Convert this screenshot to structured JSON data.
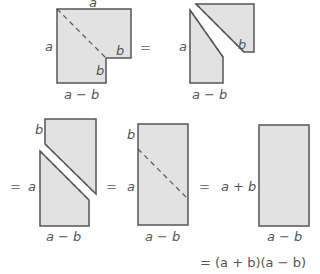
{
  "figure": {
    "type": "difference-of-squares proof",
    "colors": {
      "fill": "#e2e2e2",
      "stroke": "#555555",
      "text": "#555555"
    },
    "step1": {
      "top": "a",
      "left": "a",
      "inner_right": "b",
      "inner_bottom": "b",
      "bottom": "a − b"
    },
    "step2": {
      "left": "a",
      "inner_right": "b",
      "bottom": "a − b"
    },
    "step3": {
      "left": "a",
      "top_left": "b",
      "bottom": "a − b"
    },
    "step4": {
      "left": "a",
      "top_left": "b",
      "bottom": "a − b"
    },
    "step5": {
      "left": "a + b",
      "bottom": "a − b"
    },
    "equals": "=",
    "result": "= (a + b)(a − b)"
  }
}
